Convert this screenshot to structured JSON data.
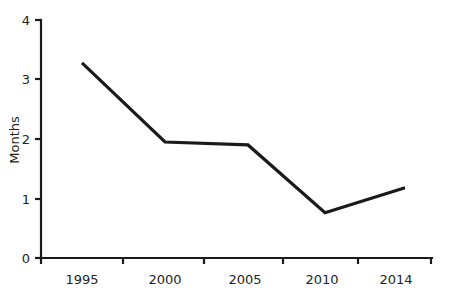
{
  "chart_data": {
    "type": "line",
    "title": "",
    "subtitle": "",
    "xlabel": "",
    "ylabel": "Months",
    "categories": [
      "1995",
      "2000",
      "2005",
      "2010",
      "2014"
    ],
    "x": [
      1995,
      2000,
      2005,
      2010,
      2014
    ],
    "values": [
      3.28,
      1.95,
      1.9,
      0.76,
      1.18
    ],
    "series": [
      {
        "name": "Months",
        "values": [
          3.28,
          1.95,
          1.9,
          0.76,
          1.18
        ],
        "color": "#1a1a1a"
      }
    ],
    "ylim": [
      0,
      4
    ],
    "yticks": [
      0,
      1,
      2,
      3,
      4
    ],
    "ytick_labels": [
      "0",
      "1",
      "2",
      "3",
      "4"
    ],
    "xtick_labels": [
      "1995",
      "2000",
      "2005",
      "2010",
      "2014"
    ],
    "grid": false,
    "legend": false,
    "legend_position": "none",
    "annotations": []
  },
  "axes": {
    "y_title": "Months",
    "y_tick_0": "0",
    "y_tick_1": "1",
    "y_tick_2": "2",
    "y_tick_3": "3",
    "y_tick_4": "4",
    "x_tick_0": "1995",
    "x_tick_1": "2000",
    "x_tick_2": "2005",
    "x_tick_3": "2010",
    "x_tick_4": "2014"
  },
  "style": {
    "line_color": "#1a1a1a",
    "axis_color": "#1a1a1a",
    "text_color": "#231f20",
    "background": "#ffffff"
  }
}
